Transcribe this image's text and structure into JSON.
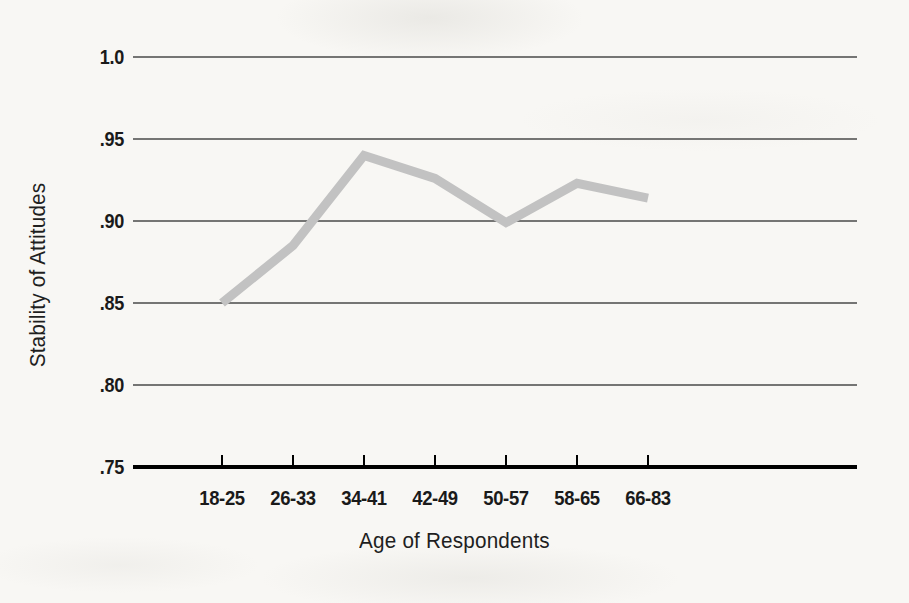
{
  "chart_data": {
    "type": "line",
    "title": "",
    "xlabel": "Age of Respondents",
    "ylabel": "Stability of Attitudes",
    "categories": [
      "18-25",
      "26-33",
      "34-41",
      "42-49",
      "50-57",
      "58-65",
      "66-83"
    ],
    "values": [
      0.85,
      0.885,
      0.94,
      0.926,
      0.899,
      0.923,
      0.914
    ],
    "series": [
      {
        "name": "Stability of Attitudes",
        "values": [
          0.85,
          0.885,
          0.94,
          0.926,
          0.899,
          0.923,
          0.914
        ]
      }
    ],
    "ylim": [
      0.75,
      1.0
    ],
    "ytick_labels": [
      "1.0",
      ".95",
      ".90",
      ".85",
      ".80",
      ".75"
    ],
    "ytick_values": [
      1.0,
      0.95,
      0.9,
      0.85,
      0.8,
      0.75
    ],
    "grid": true,
    "grid_axis": "y",
    "legend": false,
    "legend_position": "none",
    "line_color": "#c2c2c2",
    "line_width_px": 9,
    "gridline_color": "#4a4a4a",
    "axis_color": "#000000",
    "background_color": "#f8f7f4"
  },
  "axes": {
    "x_title": "Age of Respondents",
    "y_title": "Stability of Attitudes"
  },
  "ticks": {
    "y": [
      {
        "label": "1.0",
        "value": 1.0,
        "py": 57
      },
      {
        "label": ".95",
        "value": 0.95,
        "py": 139
      },
      {
        "label": ".90",
        "value": 0.9,
        "py": 221
      },
      {
        "label": ".85",
        "value": 0.85,
        "py": 303
      },
      {
        "label": ".80",
        "value": 0.8,
        "py": 385
      },
      {
        "label": ".75",
        "value": 0.75,
        "py": 467
      }
    ],
    "x": [
      {
        "label": "18-25",
        "px": 222
      },
      {
        "label": "26-33",
        "px": 293
      },
      {
        "label": "34-41",
        "px": 364
      },
      {
        "label": "42-49",
        "px": 435
      },
      {
        "label": "50-57",
        "px": 506
      },
      {
        "label": "58-65",
        "px": 577
      },
      {
        "label": "66-83",
        "px": 648
      }
    ]
  },
  "geometry": {
    "plot_left": 133,
    "plot_right": 857,
    "plot_top": 57,
    "plot_bottom": 467,
    "point_pixels": [
      {
        "x": 222,
        "y": 303
      },
      {
        "x": 293,
        "y": 246
      },
      {
        "x": 364,
        "y": 155
      },
      {
        "x": 435,
        "y": 178
      },
      {
        "x": 506,
        "y": 222
      },
      {
        "x": 577,
        "y": 182
      },
      {
        "x": 648,
        "y": 196
      }
    ]
  }
}
